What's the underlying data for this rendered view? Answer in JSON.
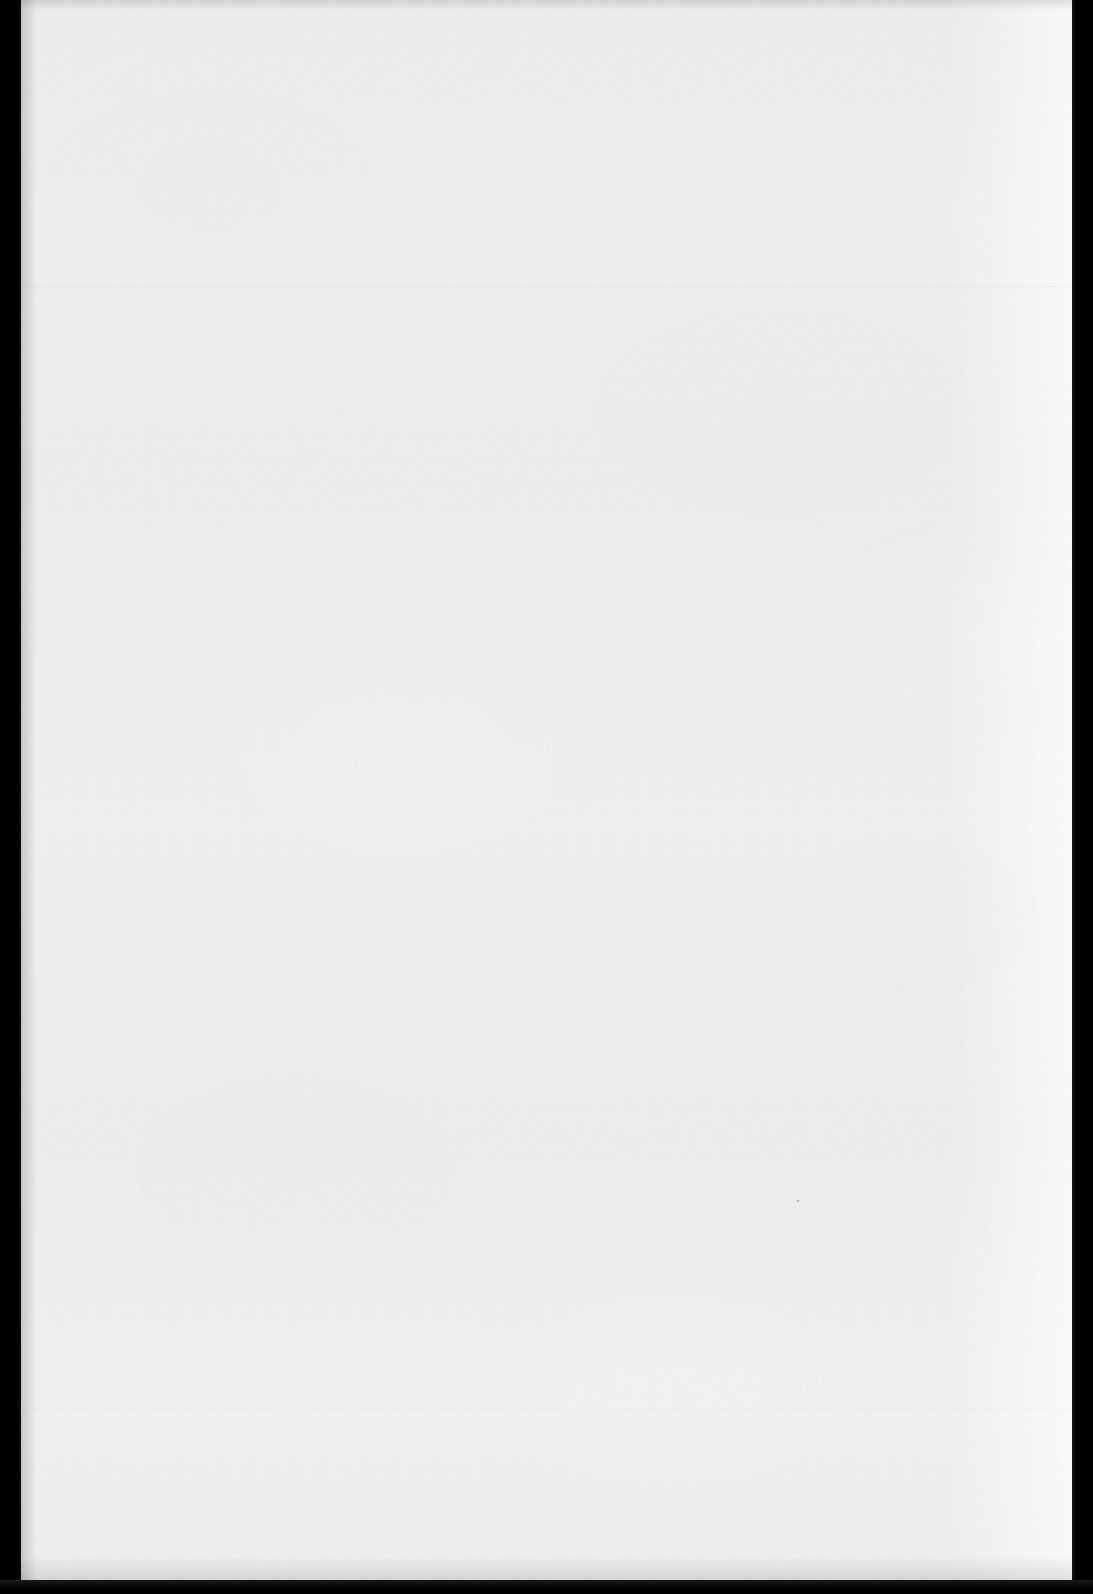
{
  "document": {
    "kind": "scanned-page",
    "content_state": "blank",
    "visible_text": "",
    "description": "Blank scanned page with paper grain texture and black scanner bands along the left and right margins."
  },
  "page": {
    "width_px": 1093,
    "height_px": 1594,
    "paper_left_px": 21,
    "paper_top_px": 0,
    "paper_width_px": 1051,
    "paper_height_px": 1580,
    "paper_color": "#eeeeef",
    "paper_color_light": "#f2f2f3",
    "paper_color_shade": "#ececed"
  },
  "scanner_bands": {
    "background_color": "#010101",
    "left": {
      "x_px": 0,
      "width_px": 21
    },
    "right": {
      "x_px": 1072,
      "width_px": 21
    },
    "bottom": {
      "y_px": 1580,
      "height_px": 14
    }
  },
  "artifacts": {
    "creases": [
      {
        "name": "upper-crease",
        "y_px": 285
      },
      {
        "name": "lower-crease",
        "y_px": 1408
      }
    ],
    "specks": [
      {
        "name": "dust-speck",
        "x_px": 797,
        "y_px": 1200
      }
    ],
    "page_curl_highlight_edge": "right"
  }
}
